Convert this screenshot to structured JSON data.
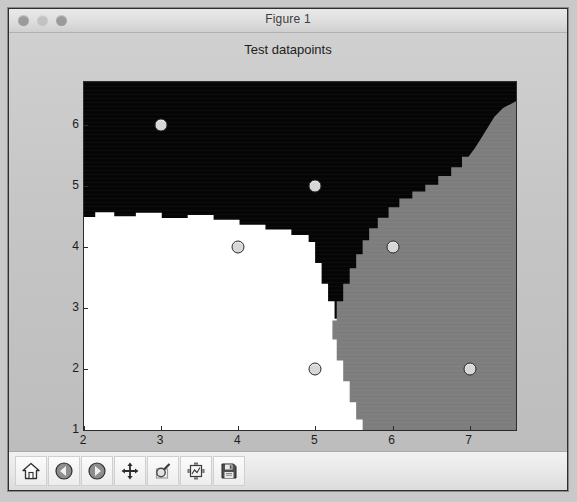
{
  "window": {
    "title": "Figure 1",
    "controls": [
      {
        "name": "close-button",
        "color": "#9b9b9b"
      },
      {
        "name": "minimize-button",
        "color": "#c2c2c2"
      },
      {
        "name": "zoom-button",
        "color": "#9b9b9b"
      }
    ]
  },
  "chart_data": {
    "type": "scatter",
    "title": "Test datapoints",
    "xlabel": "",
    "ylabel": "",
    "xlim": [
      2,
      7.6
    ],
    "ylim": [
      1,
      6.7
    ],
    "xticks": [
      2,
      3,
      4,
      5,
      6,
      7
    ],
    "yticks": [
      1,
      2,
      3,
      4,
      5,
      6
    ],
    "grid": false,
    "legend": null,
    "points": [
      {
        "x": 3,
        "y": 6,
        "label": "p1"
      },
      {
        "x": 5,
        "y": 5,
        "label": "p2"
      },
      {
        "x": 4,
        "y": 4,
        "label": "p3"
      },
      {
        "x": 6,
        "y": 4,
        "label": "p4"
      },
      {
        "x": 5,
        "y": 2,
        "label": "p5"
      },
      {
        "x": 7,
        "y": 2,
        "label": "p6"
      }
    ],
    "marker_face_color": "#d7d7d7",
    "marker_edge_color": "#2a2a2a",
    "background_regions": [
      {
        "class": "black",
        "color": "#050505"
      },
      {
        "class": "white",
        "color": "#ffffff"
      },
      {
        "class": "gray",
        "color": "#7d7d7d"
      }
    ]
  },
  "toolbar": {
    "buttons": [
      {
        "name": "home-button",
        "tooltip": "Reset original view"
      },
      {
        "name": "back-button",
        "tooltip": "Back to previous view"
      },
      {
        "name": "forward-button",
        "tooltip": "Forward to next view"
      },
      {
        "name": "pan-button",
        "tooltip": "Pan axes with left mouse, zoom with right"
      },
      {
        "name": "zoom-button",
        "tooltip": "Zoom to rectangle"
      },
      {
        "name": "configure-subplots-button",
        "tooltip": "Configure subplots"
      },
      {
        "name": "save-button",
        "tooltip": "Save the figure"
      }
    ]
  }
}
